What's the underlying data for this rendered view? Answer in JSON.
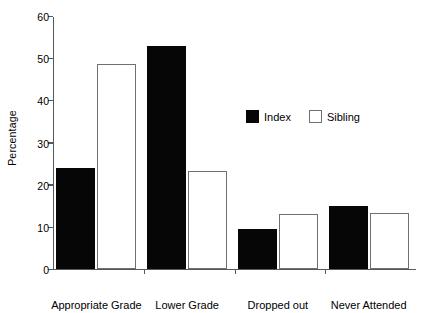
{
  "chart_data": {
    "type": "bar",
    "title": "",
    "xlabel": "",
    "ylabel": "Percentage",
    "ylim": [
      0,
      60
    ],
    "yticks": [
      0,
      10,
      20,
      30,
      40,
      50,
      60
    ],
    "grid": false,
    "legend_position": "center-right",
    "categories": [
      "Appropriate Grade",
      "Lower Grade",
      "Dropped out",
      "Never Attended"
    ],
    "series": [
      {
        "name": "Index",
        "color": "#060606",
        "values": [
          24.0,
          53.0,
          9.5,
          15.0
        ]
      },
      {
        "name": "Sibling",
        "color": "#ffffff",
        "values": [
          48.7,
          23.2,
          13.0,
          13.3
        ]
      }
    ]
  },
  "legend": {
    "items": [
      {
        "label": "Index"
      },
      {
        "label": "Sibling"
      }
    ]
  },
  "axis": {
    "y_label": "Percentage",
    "y_tick_labels": [
      "0",
      "10",
      "20",
      "30",
      "40",
      "50",
      "60"
    ]
  }
}
